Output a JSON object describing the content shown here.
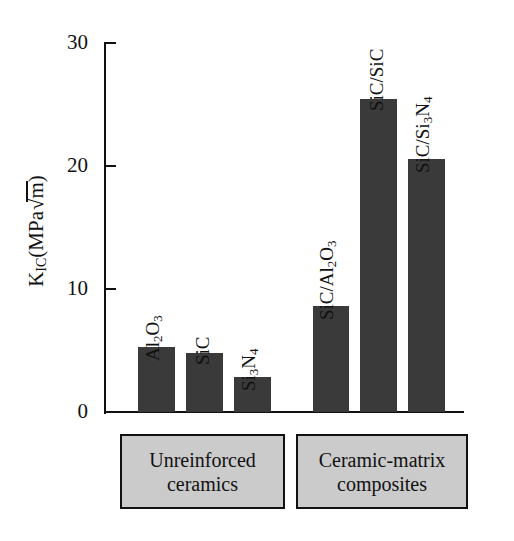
{
  "chart_data": {
    "type": "bar",
    "title": "",
    "xlabel": "",
    "ylabel": "K_IC(MPa√m)",
    "ylabel_parts": {
      "k": "K",
      "ic": "IC",
      "open": "(MPa",
      "radical": "√",
      "m": "m",
      "close": ")"
    },
    "ylim": [
      0,
      30
    ],
    "yticks": [
      "0",
      "10",
      "20",
      "30"
    ],
    "ytick_values": [
      0,
      10,
      20,
      30
    ],
    "grid": false,
    "legend_position": "below-axis",
    "categories": [
      "Al2O3",
      "SiC",
      "Si3N4",
      "SiC/Al2O3",
      "SiC/SiC",
      "SiC/Si3N4"
    ],
    "values": [
      5.3,
      4.8,
      2.8,
      8.6,
      25.4,
      20.5
    ],
    "bar_color": "#3a3a3a",
    "axis_color": "#111111",
    "groups": [
      {
        "name": "Unreinforced ceramics",
        "line1": "Unreinforced",
        "line2": "ceramics",
        "members": [
          "Al2O3",
          "SiC",
          "Si3N4"
        ]
      },
      {
        "name": "Ceramic-matrix composites",
        "line1": "Ceramic-matrix",
        "line2": "composites",
        "members": [
          "SiC/Al2O3",
          "SiC/SiC",
          "SiC/Si3N4"
        ]
      }
    ],
    "bar_labels": [
      {
        "pre": "Al",
        "sub1": "2",
        "mid": "O",
        "sub2": "3",
        "post": ""
      },
      {
        "pre": "SiC",
        "sub1": "",
        "mid": "",
        "sub2": "",
        "post": ""
      },
      {
        "pre": "Si",
        "sub1": "3",
        "mid": "N",
        "sub2": "4",
        "post": ""
      },
      {
        "pre": "SiC/Al",
        "sub1": "2",
        "mid": "O",
        "sub2": "3",
        "post": ""
      },
      {
        "pre": "SiC/SiC",
        "sub1": "",
        "mid": "",
        "sub2": "",
        "post": ""
      },
      {
        "pre": "SiC/Si",
        "sub1": "3",
        "mid": "N",
        "sub2": "4",
        "post": ""
      }
    ]
  },
  "legend": {
    "group_1_line_1": "Unreinforced",
    "group_1_line_2": "ceramics",
    "group_2_line_1": "Ceramic-matrix",
    "group_2_line_2": "composites",
    "box_fill": "#cbcbcb"
  },
  "axis": {
    "tick_30": "30",
    "tick_20": "20",
    "tick_10": "10",
    "tick_0": "0"
  }
}
